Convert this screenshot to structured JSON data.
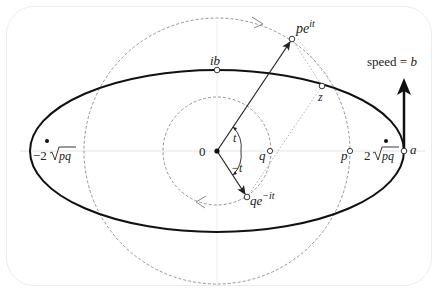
{
  "figure": {
    "type": "complex-plane-ellipse-diagram",
    "labels": {
      "origin": "0",
      "ib": "ib",
      "pe_it": "pe",
      "pe_it_sup": "it",
      "qe_neg_it": "qe",
      "qe_neg_it_sup": "−it",
      "z": "z",
      "p": "p",
      "q": "q",
      "a": "a",
      "t": "t",
      "neg_t": "−t",
      "focus_left": "−2",
      "focus_right": "2",
      "sqrt_arg": "pq",
      "speed_prefix": "speed = ",
      "speed_var": "b"
    },
    "colors": {
      "ink": "#222222",
      "dashed": "#8a8a8a",
      "axis": "#e4e4e4",
      "panel_border": "#ececec"
    }
  }
}
